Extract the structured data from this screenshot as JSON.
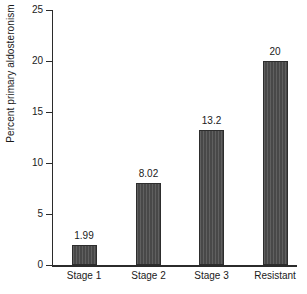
{
  "chart_data": {
    "type": "bar",
    "title": "",
    "xlabel": "",
    "ylabel": "Percent primary aldosteronism",
    "categories": [
      "Stage 1",
      "Stage 2",
      "Stage 3",
      "Resistant"
    ],
    "values": [
      1.99,
      8.02,
      13.2,
      20
    ],
    "value_labels": [
      "1.99",
      "8.02",
      "13.2",
      "20"
    ],
    "ylim": [
      0,
      25
    ],
    "yticks": [
      0,
      5,
      10,
      15,
      20,
      25
    ],
    "ytick_labels": [
      "0",
      "5",
      "10",
      "15",
      "20",
      "25"
    ],
    "grid": false,
    "legend": false,
    "bar_color": "#4c4c4c",
    "bar_edge_color": "#2d2d2d",
    "axis_color": "#2b2b2b",
    "background": "#ffffff"
  }
}
